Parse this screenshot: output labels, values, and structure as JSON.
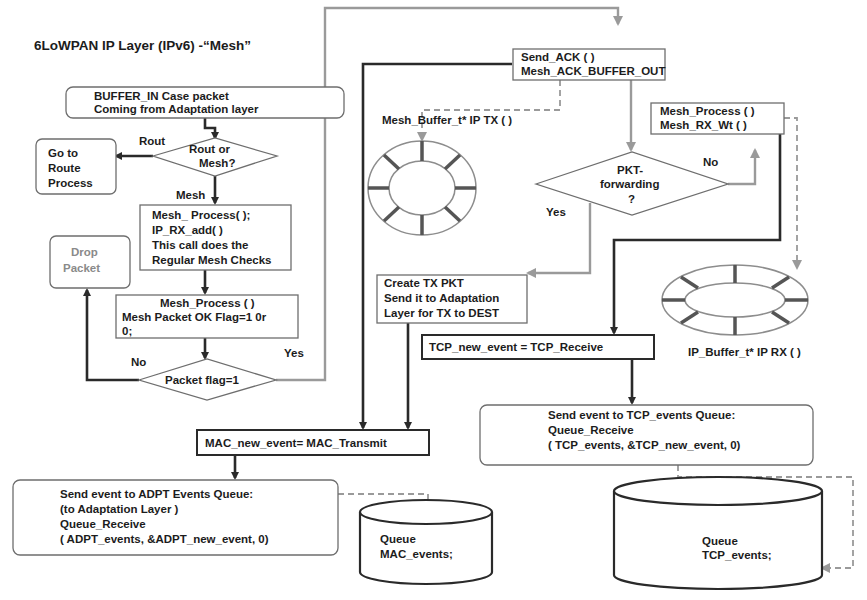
{
  "title": "6LoWPAN IP Layer (IPv6) -“Mesh”",
  "nodes": {
    "buffer_in": [
      "BUFFER_IN Case packet",
      "Coming from Adaptation layer"
    ],
    "rout_or_mesh": [
      "Rout   or",
      "Mesh?"
    ],
    "go_to_route": [
      "Go to",
      "Route",
      "Process"
    ],
    "mesh_process_1": [
      "Mesh_ Process( );",
      "IP_RX_add( )",
      "This call does the",
      "Regular Mesh Checks"
    ],
    "drop_packet": [
      "Drop",
      "Packet"
    ],
    "mesh_process_2": [
      "Mesh_Process ( )",
      "Mesh Packet OK Flag=1 0r",
      "0;"
    ],
    "packet_flag": "Packet flag=1",
    "send_ack": [
      "Send_ACK ( )",
      "Mesh_ACK_BUFFER_OUT"
    ],
    "mesh_process_rx": [
      "Mesh_Process ( )",
      "Mesh_RX_Wt ( )"
    ],
    "pkt_forwarding": [
      "PKT-",
      "forwarding",
      "?"
    ],
    "create_tx_pkt": [
      "Create TX PKT",
      "Send it to Adaptation",
      "Layer for TX to DEST"
    ],
    "tcp_new_event": "TCP_new_event = TCP_Receive",
    "mac_new_event": "MAC_new_event= MAC_Transmit",
    "send_adpt": [
      "Send event to ADPT Events Queue:",
      "(to Adaptation Layer )",
      "Queue_Receive",
      "( ADPT_events,  &ADPT_new_event, 0)"
    ],
    "send_tcp": [
      "Send event to TCP_events Queue:",
      "Queue_Receive",
      "( TCP_events,  &TCP_new_event, 0)"
    ],
    "queue_mac": [
      "Queue",
      "MAC_events;"
    ],
    "queue_tcp": [
      "Queue",
      "TCP_events;"
    ]
  },
  "labels": {
    "rout": "Rout",
    "mesh": "Mesh",
    "no_left": "No",
    "yes_left": "Yes",
    "yes_mid": "Yes",
    "no_right": "No",
    "mesh_buffer_tx": "Mesh_Buffer_t*  IP TX ( )",
    "ip_buffer_rx": "IP_Buffer_t*  IP RX ( )"
  },
  "colors": {
    "dark_line": "#2a2a2a",
    "gray_line": "#9a9a9a",
    "box_border": "#6e6e6e",
    "background": "#ffffff"
  }
}
